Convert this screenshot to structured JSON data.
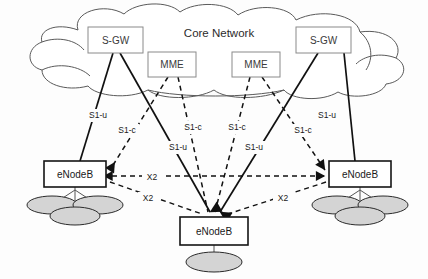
{
  "diagram": {
    "cloud": {
      "label": "Core Network"
    },
    "core_nodes": [
      {
        "id": "sgw-left",
        "label": "S-GW",
        "x": 88,
        "y": 27,
        "w": 55,
        "h": 26
      },
      {
        "id": "mme-left",
        "label": "MME",
        "x": 148,
        "y": 52,
        "w": 48,
        "h": 25
      },
      {
        "id": "mme-right",
        "label": "MME",
        "x": 232,
        "y": 52,
        "w": 48,
        "h": 25
      },
      {
        "id": "sgw-right",
        "label": "S-GW",
        "x": 296,
        "y": 27,
        "w": 55,
        "h": 26
      }
    ],
    "base_stations": [
      {
        "id": "enb-left",
        "label": "eNodeB",
        "x": 44,
        "y": 161,
        "w": 62,
        "h": 26,
        "sectors": 3
      },
      {
        "id": "enb-right",
        "label": "eNodeB",
        "x": 329,
        "y": 161,
        "w": 62,
        "h": 26,
        "sectors": 3
      },
      {
        "id": "enb-center",
        "label": "eNodeB",
        "x": 180,
        "y": 217,
        "w": 68,
        "h": 28,
        "sectors": 1
      }
    ],
    "link_labels": [
      {
        "id": "s1u-l1",
        "text": "S1-u",
        "x": 98,
        "y": 116
      },
      {
        "id": "s1c-l1",
        "text": "S1-c",
        "x": 127,
        "y": 131
      },
      {
        "id": "s1c-l2",
        "text": "S1-c",
        "x": 193,
        "y": 128
      },
      {
        "id": "s1u-l2",
        "text": "S1-u",
        "x": 178,
        "y": 148
      },
      {
        "id": "s1c-r2",
        "text": "S1-c",
        "x": 237,
        "y": 128
      },
      {
        "id": "s1u-r2",
        "text": "S1-u",
        "x": 254,
        "y": 148
      },
      {
        "id": "s1c-r1",
        "text": "S1-c",
        "x": 303,
        "y": 131
      },
      {
        "id": "s1u-r1",
        "text": "S1-u",
        "x": 327,
        "y": 116
      },
      {
        "id": "x2-top",
        "text": "X2",
        "x": 152,
        "y": 178
      },
      {
        "id": "x2-left",
        "text": "X2",
        "x": 148,
        "y": 199
      },
      {
        "id": "x2-right",
        "text": "X2",
        "x": 283,
        "y": 199
      }
    ],
    "link_types": {
      "s1u": "solid",
      "s1c": "dashed",
      "x2": "dashed"
    },
    "colors": {
      "background": "#fdfdfd",
      "cloud_stroke": "#5a5a5a",
      "core_box_stroke": "#8a8a8a",
      "enb_box_stroke": "#141414",
      "sector_fill": "#d4d4d4",
      "link": "#111111"
    }
  }
}
